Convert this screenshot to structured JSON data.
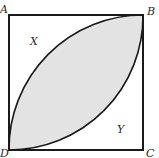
{
  "diagram": {
    "type": "square-with-lens",
    "vertices": {
      "A": "A",
      "B": "B",
      "C": "C",
      "D": "D"
    },
    "regions": {
      "upper_left": "X",
      "lower_right": "Y"
    },
    "colors": {
      "stroke": "#1a1a1a",
      "shaded_fill": "#e3e3e3",
      "background": "#ffffff",
      "label": "#2a2a2a"
    }
  }
}
